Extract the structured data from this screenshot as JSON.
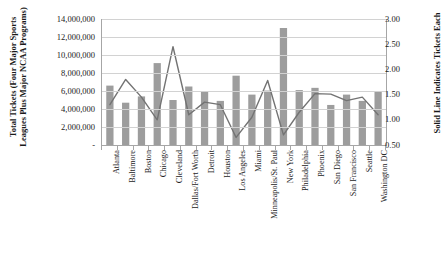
{
  "chart_data": {
    "type": "bar",
    "title": "",
    "subtitle": "",
    "xlabel": "",
    "ylabel": "Total Tickets (Four Major Sports Leagues Plus Major NCAA Programs)",
    "y2label": "Solid Line Indicates Tickets Each",
    "grid": true,
    "legend": "none",
    "ylim": [
      0,
      14000000
    ],
    "y2lim": [
      0.5,
      3.0
    ],
    "ytick_labels": [
      "14,000,000",
      "12,000,000",
      "10,000,000",
      "8,000,000",
      "6,000,000",
      "4,000,000",
      "2,000,000",
      "-"
    ],
    "ytick_values": [
      14000000,
      12000000,
      10000000,
      8000000,
      6000000,
      4000000,
      2000000,
      0
    ],
    "y2tick_labels": [
      "3.00",
      "2.50",
      "2.00",
      "1.50",
      "1.00",
      "0.50"
    ],
    "y2tick_values": [
      3.0,
      2.5,
      2.0,
      1.5,
      1.0,
      0.5
    ],
    "categories": [
      "Atlanta",
      "Baltimore",
      "Boston",
      "Chicago",
      "Cleveland",
      "Dallas/Fort Worth",
      "Detroit",
      "Houston",
      "Los Angeles",
      "Miami",
      "Minneapolis/St. Paul",
      "New York",
      "Philadelphia",
      "Phoenix",
      "San Diego",
      "San Francisco",
      "Seattle",
      "Washington DC"
    ],
    "series": [
      {
        "name": "Total Tickets (Four Major Sports Leagues Plus Major NCAA Programs)",
        "render": "bar",
        "axis": "left",
        "color": "#9d9d9d",
        "values": [
          6600000,
          4700000,
          5400000,
          9100000,
          5000000,
          6500000,
          5950000,
          4900000,
          7700000,
          5600000,
          6050000,
          13000000,
          6100000,
          6350000,
          4450000,
          5600000,
          4900000,
          5900000
        ]
      },
      {
        "name": "Solid Line Indicates Tickets Each",
        "render": "line",
        "axis": "right",
        "color": "#737373",
        "values": [
          1.3,
          1.8,
          1.45,
          1.0,
          2.45,
          1.1,
          1.35,
          1.3,
          0.65,
          1.05,
          1.78,
          0.7,
          1.15,
          1.52,
          1.51,
          1.38,
          1.45,
          1.1
        ]
      }
    ]
  }
}
